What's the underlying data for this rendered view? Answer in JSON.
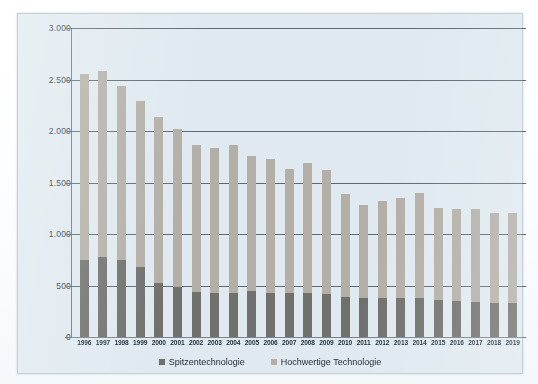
{
  "chart_data": {
    "type": "bar",
    "stacked": true,
    "title": "",
    "subtitle": "",
    "xlabel": "",
    "ylabel": "",
    "ylim": [
      0,
      3000
    ],
    "ytick_labels": [
      "3.000",
      "2.500",
      "2.000",
      "1.500",
      "1.000",
      "500",
      "0"
    ],
    "ytick_values": [
      3000,
      2500,
      2000,
      1500,
      1000,
      500,
      0
    ],
    "grid": true,
    "legend_position": "bottom",
    "categories": [
      "1996",
      "1997",
      "1998",
      "1999",
      "2000",
      "2001",
      "2002",
      "2003",
      "2004",
      "2005",
      "2006",
      "2007",
      "2008",
      "2009",
      "2010",
      "2011",
      "2012",
      "2013",
      "2014",
      "2015",
      "2016",
      "2017",
      "2018",
      "2019"
    ],
    "series": [
      {
        "name": "Spitzentechnologie",
        "color": "#70706c",
        "values": [
          750,
          775,
          745,
          680,
          520,
          490,
          440,
          430,
          425,
          450,
          425,
          425,
          430,
          420,
          385,
          375,
          380,
          375,
          380,
          355,
          350,
          340,
          330,
          335
        ]
      },
      {
        "name": "Hochwertige Technologie",
        "color": "#b3afa7",
        "values": [
          1800,
          1805,
          1690,
          1610,
          1620,
          1530,
          1425,
          1405,
          1435,
          1305,
          1300,
          1210,
          1255,
          1205,
          1005,
          905,
          940,
          970,
          1015,
          900,
          890,
          900,
          870,
          870
        ]
      }
    ],
    "totals": [
      2550,
      2580,
      2435,
      2290,
      2140,
      2020,
      1865,
      1835,
      1860,
      1755,
      1725,
      1635,
      1685,
      1625,
      1390,
      1280,
      1320,
      1345,
      1395,
      1255,
      1240,
      1240,
      1200,
      1205
    ]
  },
  "legend": {
    "items": [
      {
        "label": "Spitzentechnologie",
        "color": "#70706c"
      },
      {
        "label": "Hochwertige Technologie",
        "color": "#b3afa7"
      }
    ]
  },
  "colors": {
    "plot_background": "#dfe9ef",
    "gridline": "#5d6a70",
    "page_background": "#ffffff"
  }
}
